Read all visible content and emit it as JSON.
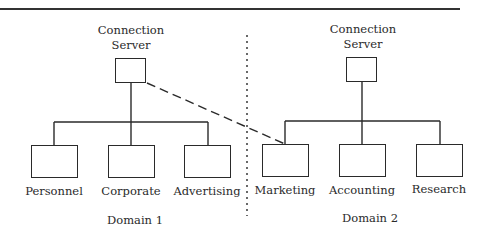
{
  "diagram": {
    "type": "network-topology",
    "domains": [
      {
        "id": "domain1",
        "label": "Domain 1",
        "server": {
          "label_line1": "Connection",
          "label_line2": "Server"
        },
        "nodes": [
          {
            "label": "Personnel"
          },
          {
            "label": "Corporate"
          },
          {
            "label": "Advertising"
          }
        ]
      },
      {
        "id": "domain2",
        "label": "Domain 2",
        "server": {
          "label_line1": "Connection",
          "label_line2": "Server"
        },
        "nodes": [
          {
            "label": "Marketing"
          },
          {
            "label": "Accounting"
          },
          {
            "label": "Research"
          }
        ]
      }
    ],
    "edges": [
      {
        "from": "Domain 1 Connection Server",
        "to": "Personnel",
        "style": "solid"
      },
      {
        "from": "Domain 1 Connection Server",
        "to": "Corporate",
        "style": "solid"
      },
      {
        "from": "Domain 1 Connection Server",
        "to": "Advertising",
        "style": "solid"
      },
      {
        "from": "Domain 2 Connection Server",
        "to": "Marketing",
        "style": "solid"
      },
      {
        "from": "Domain 2 Connection Server",
        "to": "Accounting",
        "style": "solid"
      },
      {
        "from": "Domain 2 Connection Server",
        "to": "Research",
        "style": "solid"
      },
      {
        "from": "Domain 1 Connection Server",
        "to": "Marketing",
        "style": "dashed"
      }
    ],
    "divider": {
      "style": "dotted",
      "separates": [
        "Domain 1",
        "Domain 2"
      ]
    },
    "colors": {
      "line": "#2a2a2a",
      "background": "#ffffff"
    }
  }
}
